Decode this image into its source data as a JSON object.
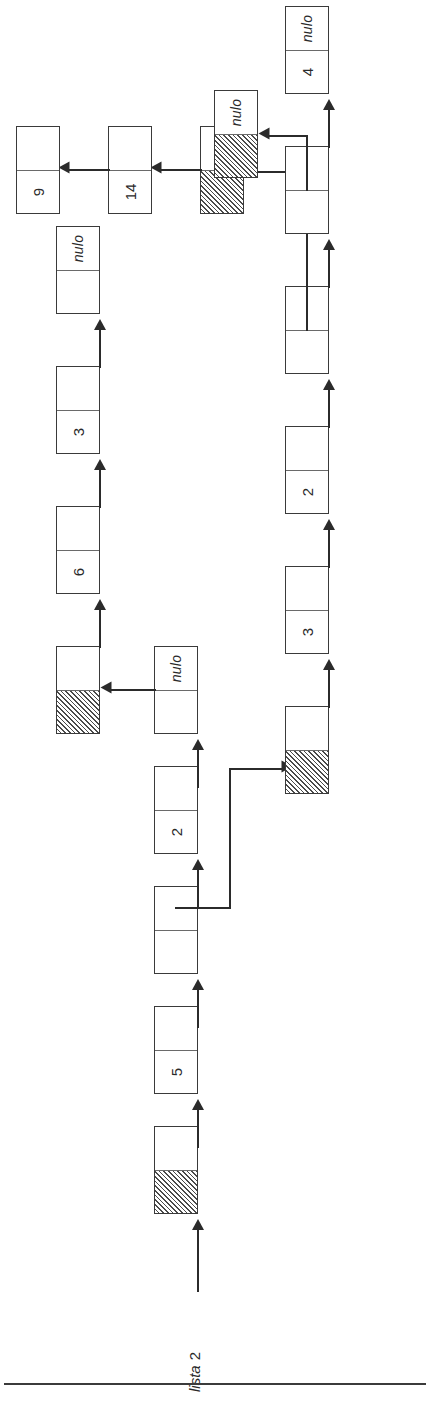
{
  "figure": {
    "label": {
      "name": "lista",
      "index": "2"
    },
    "null_text": "nulo",
    "ink_color": "#2b2b2b",
    "box_border_color": "#3a3a3a",
    "hatch_color": "#4a4a4a",
    "orientation_degrees": "-90"
  },
  "rows": [
    {
      "id": "row-main",
      "name": "main-list",
      "nodes": [
        {
          "data": "",
          "data_kind": "hatched",
          "pointer": "",
          "pointer_kind": "link-down"
        },
        {
          "data": "5",
          "data_kind": "value",
          "pointer": "",
          "pointer_kind": "link"
        },
        {
          "data": "",
          "data_kind": "blank",
          "pointer": "",
          "pointer_kind": "link-cross"
        },
        {
          "data": "2",
          "data_kind": "value",
          "pointer": "",
          "pointer_kind": "link"
        },
        {
          "data": "",
          "data_kind": "blank",
          "pointer": "nulo",
          "pointer_kind": "link-cross-null"
        }
      ]
    },
    {
      "id": "row-sub-a",
      "name": "sublist-a",
      "nodes": [
        {
          "data": "",
          "data_kind": "hatched",
          "pointer": "",
          "pointer_kind": "link"
        },
        {
          "data": "6",
          "data_kind": "value",
          "pointer": "",
          "pointer_kind": "link"
        },
        {
          "data": "3",
          "data_kind": "value",
          "pointer": "",
          "pointer_kind": "link"
        },
        {
          "data": "",
          "data_kind": "blank",
          "pointer": "nulo",
          "pointer_kind": "null"
        }
      ]
    },
    {
      "id": "row-sub-b",
      "name": "sublist-b",
      "nodes": [
        {
          "data": "",
          "data_kind": "hatched",
          "pointer": "",
          "pointer_kind": "link"
        },
        {
          "data": "3",
          "data_kind": "value",
          "pointer": "",
          "pointer_kind": "link"
        },
        {
          "data": "2",
          "data_kind": "value",
          "pointer": "",
          "pointer_kind": "link"
        },
        {
          "data": "",
          "data_kind": "blank",
          "pointer": "",
          "pointer_kind": "link-cross"
        },
        {
          "data": "",
          "data_kind": "blank",
          "pointer": "",
          "pointer_kind": "link-cross"
        },
        {
          "data": "4",
          "data_kind": "value",
          "pointer": "nulo",
          "pointer_kind": "null"
        }
      ]
    },
    {
      "id": "row-sub-c",
      "name": "sublist-c",
      "nodes": [
        {
          "data": "",
          "data_kind": "hatched",
          "pointer": "",
          "pointer_kind": "link"
        },
        {
          "data": "14",
          "data_kind": "value",
          "pointer": "",
          "pointer_kind": "link"
        },
        {
          "data": "9",
          "data_kind": "value",
          "pointer": "",
          "pointer_kind": "link"
        },
        {
          "data": "3",
          "data_kind": "value",
          "pointer": "nulo",
          "pointer_kind": "null"
        }
      ]
    },
    {
      "id": "row-sub-d",
      "name": "sublist-d",
      "nodes": [
        {
          "data": "",
          "data_kind": "hatched",
          "pointer": "nulo",
          "pointer_kind": "null"
        }
      ]
    }
  ]
}
